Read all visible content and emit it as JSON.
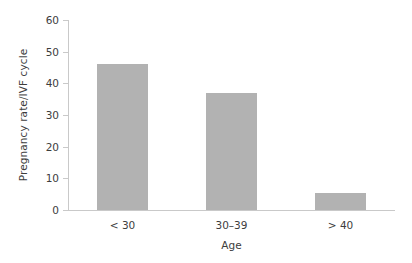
{
  "chart_data": {
    "type": "bar",
    "title": "",
    "subtitle": "",
    "xlabel": "Age",
    "ylabel": "Pregnancy rate/IVF cycle",
    "categories": [
      "< 30",
      "30–39",
      "> 40"
    ],
    "values": [
      46,
      37,
      5.5
    ],
    "series": [
      {
        "name": "Pregnancy rate/IVF cycle",
        "values": [
          46,
          37,
          5.5
        ]
      }
    ],
    "ylim": [
      0,
      60
    ],
    "yticks": [
      0,
      10,
      20,
      30,
      40,
      50,
      60
    ],
    "ytick_labels": [
      "0",
      "10",
      "20",
      "30",
      "40",
      "50",
      "60"
    ],
    "xtick_labels": [
      "< 30",
      "30–39",
      "> 40"
    ],
    "grid": false,
    "legend": null,
    "legend_position": "none",
    "annotations": [],
    "bar_color": "#b2b2b2",
    "axis_color": "#c9c9c9",
    "text_color": "#3d3d3d",
    "background": "#ffffff"
  }
}
